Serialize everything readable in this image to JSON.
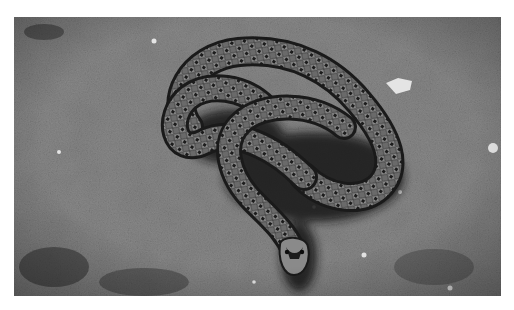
{
  "image": {
    "subject": "snake coiled on gravel ground",
    "style": "black-and-white photograph",
    "alt": "A patterned snake coiled in loops on rough, pebbly soil, head pointing toward the viewer, casting a dark shadow",
    "colors": {
      "background": "#ffffff",
      "ground_light": "#9a9a9a",
      "ground_mid": "#6f6f6f",
      "ground_dark": "#3a3a3a",
      "snake_body": "#5a5a5a",
      "snake_pattern": "#1e1e1e",
      "shadow": "#151515",
      "pebble": "#e6e6e6"
    }
  }
}
